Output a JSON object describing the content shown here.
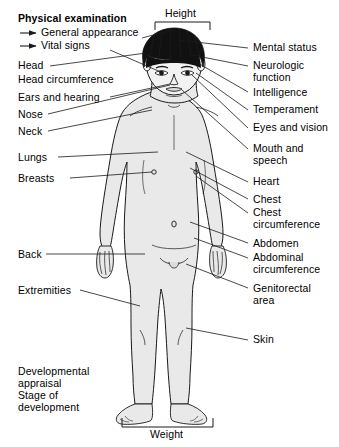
{
  "title": "Physical examination",
  "legend": [
    {
      "arrow": "→",
      "label": "General appearance"
    },
    {
      "arrow": "→",
      "label": "Vital signs"
    }
  ],
  "measurements": {
    "height": "Height",
    "weight": "Weight"
  },
  "left_labels": [
    {
      "id": "head",
      "label": "Head"
    },
    {
      "id": "head-circumference",
      "label": "Head circumference"
    },
    {
      "id": "ears-and-hearing",
      "label": "Ears and hearing"
    },
    {
      "id": "nose",
      "label": "Nose"
    },
    {
      "id": "neck",
      "label": "Neck"
    },
    {
      "id": "lungs",
      "label": "Lungs"
    },
    {
      "id": "breasts",
      "label": "Breasts"
    },
    {
      "id": "back",
      "label": "Back"
    },
    {
      "id": "extremities",
      "label": "Extremities"
    }
  ],
  "left_block": {
    "line1": "Developmental",
    "line2": "appraisal",
    "line3": "Stage of",
    "line4": "development"
  },
  "right_labels": [
    {
      "id": "mental-status",
      "label": "Mental status"
    },
    {
      "id": "neurologic-function-1",
      "label": "Neurologic"
    },
    {
      "id": "neurologic-function-2",
      "label": "function"
    },
    {
      "id": "intelligence",
      "label": "Intelligence"
    },
    {
      "id": "temperament",
      "label": "Temperament"
    },
    {
      "id": "eyes-and-vision",
      "label": "Eyes and vision"
    },
    {
      "id": "mouth-and-speech-1",
      "label": "Mouth and"
    },
    {
      "id": "mouth-and-speech-2",
      "label": "speech"
    },
    {
      "id": "heart",
      "label": "Heart"
    },
    {
      "id": "chest",
      "label": "Chest"
    },
    {
      "id": "chest-circumference-1",
      "label": "Chest"
    },
    {
      "id": "chest-circumference-2",
      "label": "circumference"
    },
    {
      "id": "abdomen",
      "label": "Abdomen"
    },
    {
      "id": "abdominal-circumference-1",
      "label": "Abdominal"
    },
    {
      "id": "abdominal-circumference-2",
      "label": "circumference"
    },
    {
      "id": "genitorectal-area-1",
      "label": "Genitorectal"
    },
    {
      "id": "genitorectal-area-2",
      "label": "area"
    },
    {
      "id": "skin",
      "label": "Skin"
    }
  ],
  "colors": {
    "line": "#1a1a1a",
    "body_fill": "#e9e9e9",
    "hair": "#111111",
    "background": "#ffffff",
    "text": "#000000"
  }
}
